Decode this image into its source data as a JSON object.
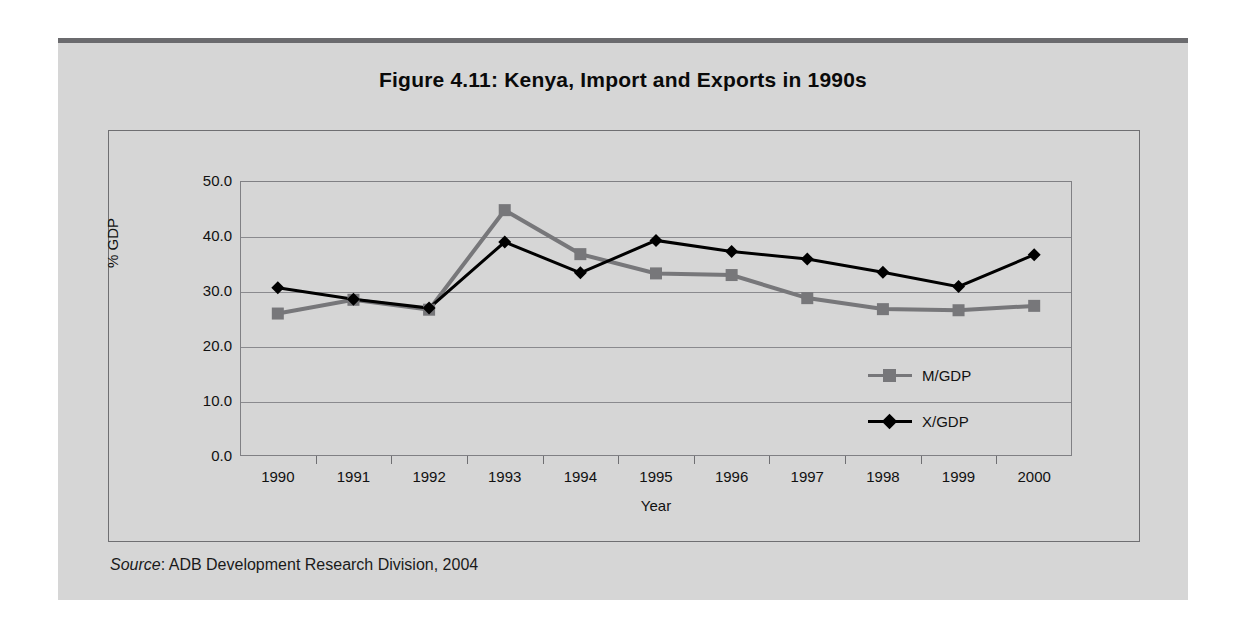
{
  "figure": {
    "title": "Figure 4.11:  Kenya, Import and Exports in 1990s",
    "source_keyword": "Source",
    "source_text": ":  ADB Development Research Division, 2004"
  },
  "colors": {
    "page_background": "#ffffff",
    "panel_background": "#d6d6d6",
    "top_rule": "#6b6b6e",
    "frame_border": "#6f6f72",
    "gridline": "#8a8a8e",
    "series_imports": "#77777a",
    "series_exports": "#000000",
    "text": "#111111"
  },
  "chart_data": {
    "type": "line",
    "title": "Figure 4.11:  Kenya, Import and Exports in 1990s",
    "xlabel": "Year",
    "ylabel": "% GDP",
    "categories": [
      "1990",
      "1991",
      "1992",
      "1993",
      "1994",
      "1995",
      "1996",
      "1997",
      "1998",
      "1999",
      "2000"
    ],
    "ylim": [
      0.0,
      50.0
    ],
    "yticks": [
      "0.0",
      "10.0",
      "20.0",
      "30.0",
      "40.0",
      "50.0"
    ],
    "ytick_values": [
      0.0,
      10.0,
      20.0,
      30.0,
      40.0,
      50.0
    ],
    "grid": true,
    "legend_position": "inside-right",
    "series": [
      {
        "name": "M/GDP",
        "marker": "square",
        "color": "#77777a",
        "values": [
          25.9,
          28.4,
          26.6,
          44.7,
          36.7,
          33.2,
          32.9,
          28.7,
          26.7,
          26.5,
          27.3
        ]
      },
      {
        "name": "X/GDP",
        "marker": "diamond",
        "color": "#000000",
        "values": [
          30.6,
          28.5,
          26.9,
          38.9,
          33.3,
          39.2,
          37.2,
          35.8,
          33.4,
          30.8,
          36.6
        ]
      }
    ]
  }
}
